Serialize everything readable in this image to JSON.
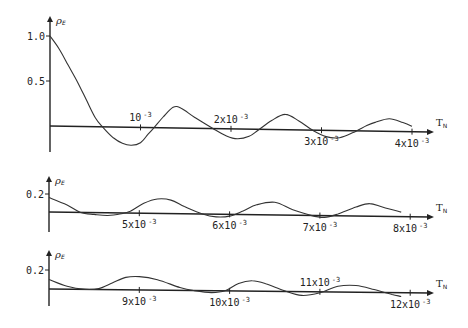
{
  "chart_data": [
    {
      "type": "line",
      "title": "",
      "ylabel": "ρE",
      "xlabel": "TN",
      "xlim": [
        0,
        0.0042
      ],
      "ylim": [
        -0.25,
        1.1
      ],
      "yticks": [
        {
          "value": 0.5,
          "label": "0.5"
        },
        {
          "value": 1.0,
          "label": "1.0"
        }
      ],
      "xticks": [
        {
          "value": 0.001,
          "label": "10",
          "exp": "-3",
          "pos": "above"
        },
        {
          "value": 0.002,
          "label": "2x10",
          "exp": "-3",
          "pos": "above"
        },
        {
          "value": 0.003,
          "label": "3x10",
          "exp": "-3",
          "pos": "below"
        },
        {
          "value": 0.004,
          "label": "4x10",
          "exp": "-3",
          "pos": "below"
        }
      ],
      "x_unit": 0.001,
      "series": [
        {
          "name": "ρE",
          "points": [
            [
              0,
              1.0
            ],
            [
              0.1,
              0.86
            ],
            [
              0.2,
              0.68
            ],
            [
              0.3,
              0.5
            ],
            [
              0.4,
              0.3
            ],
            [
              0.5,
              0.1
            ],
            [
              0.58,
              0.0
            ],
            [
              0.7,
              -0.12
            ],
            [
              0.8,
              -0.18
            ],
            [
              0.9,
              -0.2
            ],
            [
              1.0,
              -0.17
            ],
            [
              1.08,
              -0.08
            ],
            [
              1.15,
              0.0
            ],
            [
              1.25,
              0.12
            ],
            [
              1.36,
              0.23
            ],
            [
              1.45,
              0.22
            ],
            [
              1.6,
              0.12
            ],
            [
              1.8,
              0.0
            ],
            [
              1.95,
              -0.08
            ],
            [
              2.07,
              -0.11
            ],
            [
              2.2,
              -0.08
            ],
            [
              2.3,
              -0.01
            ],
            [
              2.45,
              0.1
            ],
            [
              2.6,
              0.17
            ],
            [
              2.75,
              0.1
            ],
            [
              2.9,
              0.0
            ],
            [
              3.05,
              -0.07
            ],
            [
              3.2,
              -0.08
            ],
            [
              3.35,
              -0.02
            ],
            [
              3.5,
              0.06
            ],
            [
              3.6,
              0.1
            ],
            [
              3.75,
              0.14
            ],
            [
              3.9,
              0.1
            ],
            [
              4.0,
              0.06
            ]
          ]
        }
      ]
    },
    {
      "type": "line",
      "title": "",
      "ylabel": "ρE",
      "xlabel": "TN",
      "xlim": [
        0.004,
        0.0082
      ],
      "yticks": [
        {
          "value": 0.2,
          "label": "0.2"
        }
      ],
      "xticks": [
        {
          "value": 0.005,
          "label": "5x10",
          "exp": "-3",
          "pos": "below"
        },
        {
          "value": 0.006,
          "label": "6x10",
          "exp": "-3",
          "pos": "below"
        },
        {
          "value": 0.007,
          "label": "7x10",
          "exp": "-3",
          "pos": "below"
        },
        {
          "value": 0.008,
          "label": "8x10",
          "exp": "-3",
          "pos": "below"
        }
      ],
      "x_unit": 0.001,
      "series": [
        {
          "name": "ρE",
          "points": [
            [
              4.0,
              0.16
            ],
            [
              4.2,
              0.08
            ],
            [
              4.35,
              0.0
            ],
            [
              4.5,
              -0.02
            ],
            [
              4.65,
              -0.03
            ],
            [
              4.8,
              -0.01
            ],
            [
              4.9,
              0.02
            ],
            [
              5.05,
              0.11
            ],
            [
              5.2,
              0.16
            ],
            [
              5.35,
              0.15
            ],
            [
              5.5,
              0.08
            ],
            [
              5.7,
              0.0
            ],
            [
              5.85,
              -0.03
            ],
            [
              6.0,
              -0.02
            ],
            [
              6.15,
              0.04
            ],
            [
              6.3,
              0.11
            ],
            [
              6.5,
              0.14
            ],
            [
              6.7,
              0.06
            ],
            [
              6.9,
              0.0
            ],
            [
              7.05,
              -0.02
            ],
            [
              7.2,
              0.02
            ],
            [
              7.4,
              0.1
            ],
            [
              7.55,
              0.14
            ],
            [
              7.7,
              0.1
            ],
            [
              7.9,
              0.05
            ]
          ]
        }
      ]
    },
    {
      "type": "line",
      "title": "",
      "ylabel": "ρE",
      "xlabel": "TN",
      "xlim": [
        0.008,
        0.0122
      ],
      "yticks": [
        {
          "value": 0.2,
          "label": "0.2"
        }
      ],
      "xticks": [
        {
          "value": 0.009,
          "label": "9x10",
          "exp": "-3",
          "pos": "below"
        },
        {
          "value": 0.01,
          "label": "10x10",
          "exp": "-3",
          "pos": "below"
        },
        {
          "value": 0.011,
          "label": "11x10",
          "exp": "-3",
          "pos": "above"
        },
        {
          "value": 0.012,
          "label": "12x10",
          "exp": "-3",
          "pos": "below"
        }
      ],
      "x_unit": 0.001,
      "series": [
        {
          "name": "ρE",
          "points": [
            [
              8.0,
              0.1
            ],
            [
              8.2,
              0.03
            ],
            [
              8.4,
              0.0
            ],
            [
              8.55,
              0.01
            ],
            [
              8.7,
              0.07
            ],
            [
              8.85,
              0.13
            ],
            [
              9.0,
              0.14
            ],
            [
              9.2,
              0.11
            ],
            [
              9.45,
              0.03
            ],
            [
              9.6,
              0.0
            ],
            [
              9.8,
              -0.02
            ],
            [
              9.95,
              0.0
            ],
            [
              10.1,
              0.08
            ],
            [
              10.25,
              0.11
            ],
            [
              10.4,
              0.08
            ],
            [
              10.6,
              0.01
            ],
            [
              10.8,
              -0.04
            ],
            [
              11.0,
              -0.01
            ],
            [
              11.2,
              0.06
            ],
            [
              11.4,
              0.07
            ],
            [
              11.6,
              0.03
            ],
            [
              11.8,
              -0.02
            ],
            [
              11.9,
              -0.04
            ]
          ]
        }
      ]
    }
  ],
  "labels": {
    "y_symbol": "ρ",
    "y_sub": "E",
    "x_symbol": "T",
    "x_sub": "N"
  }
}
